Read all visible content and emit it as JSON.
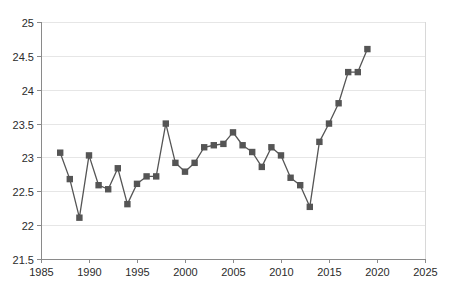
{
  "chart_data": {
    "type": "line",
    "title": "",
    "subtitle": "",
    "xlabel": "",
    "ylabel": "",
    "xlim": [
      1985,
      2025
    ],
    "ylim": [
      21.5,
      25
    ],
    "xticks": [
      1985,
      1990,
      1995,
      2000,
      2005,
      2010,
      2015,
      2020,
      2025
    ],
    "xtick_labels": [
      "1985",
      "1990",
      "1995",
      "2000",
      "2005",
      "2010",
      "2015",
      "2020",
      "2025"
    ],
    "yticks": [
      21.5,
      22,
      22.5,
      23,
      23.5,
      24,
      24.5,
      25
    ],
    "ytick_labels": [
      "21.5",
      "22",
      "22.5",
      "23",
      "23.5",
      "24",
      "24.5",
      "25"
    ],
    "grid": true,
    "grid_axis": "y",
    "legend": false,
    "legend_position": "none",
    "marker": "square",
    "marker_color": "#555555",
    "line_color": "#555555",
    "series": [
      {
        "name": "series-1",
        "x": [
          1987,
          1988,
          1989,
          1990,
          1991,
          1992,
          1993,
          1994,
          1995,
          1996,
          1997,
          1998,
          1999,
          2000,
          2001,
          2002,
          2003,
          2004,
          2005,
          2006,
          2007,
          2008,
          2009,
          2010,
          2011,
          2012,
          2013,
          2014,
          2015,
          2016,
          2017,
          2018,
          2019
        ],
        "values": [
          23.07,
          22.68,
          22.11,
          23.03,
          22.59,
          22.53,
          22.84,
          22.31,
          22.61,
          22.72,
          22.72,
          23.5,
          22.92,
          22.79,
          22.92,
          23.15,
          23.18,
          23.2,
          23.37,
          23.18,
          23.08,
          22.86,
          23.15,
          23.03,
          22.7,
          22.59,
          22.27,
          23.23,
          23.5,
          23.8,
          24.26,
          24.26,
          24.6
        ]
      }
    ]
  },
  "plot": {
    "left": 41,
    "right": 425,
    "top": 22,
    "bottom": 259
  }
}
